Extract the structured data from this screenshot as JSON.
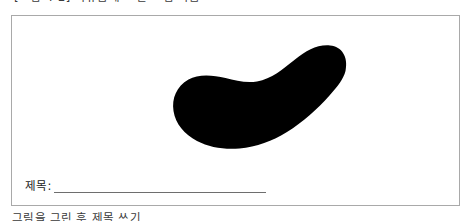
{
  "page": {
    "background_color": "#ffffff",
    "width": 473,
    "height": 221
  },
  "caption_top": {
    "text": "[그림 4-2] 자유롭게 그린 그림 작품",
    "note": "clipped at top edge of screenshot; only lowest pixel rows visible"
  },
  "caption_bottom": {
    "text": "그림을 그린 후 제목 쓰기",
    "note": "clipped at bottom edge of screenshot; only topmost pixel row visible"
  },
  "frame": {
    "border_color": "#a9a9a9",
    "fill_color": "#ffffff"
  },
  "artwork": {
    "shape_name": "kidney-bean-blob",
    "fill_color": "#000000",
    "description": "large solid black bean/kidney shaped form angled from lower-left to upper-right"
  },
  "title_field": {
    "label": "제목:",
    "value": "",
    "placeholder": "",
    "rule_color": "#6e6e6e"
  }
}
